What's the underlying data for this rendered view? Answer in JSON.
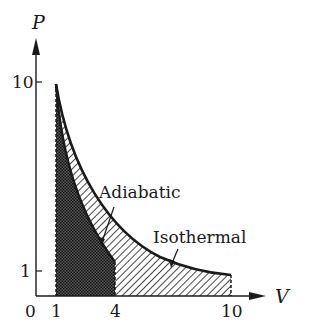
{
  "diagram": {
    "type": "PV-diagram",
    "axes": {
      "x_label": "V",
      "y_label": "P",
      "origin_label": "0",
      "x_ticks": [
        {
          "value": 1,
          "label": "1"
        },
        {
          "value": 4,
          "label": "4"
        },
        {
          "value": 10,
          "label": "10"
        }
      ],
      "y_ticks": [
        {
          "value": 10,
          "label": "10"
        },
        {
          "value": 1,
          "label": "1"
        }
      ]
    },
    "curves": [
      {
        "name": "Adiabatic",
        "label": "Adiabatic",
        "from": {
          "V": 1,
          "P": 10
        },
        "to": {
          "V": 4,
          "P": 1.4
        }
      },
      {
        "name": "Isothermal",
        "label": "Isothermal",
        "from": {
          "V": 1,
          "P": 10
        },
        "to": {
          "V": 10,
          "P": 1
        }
      }
    ],
    "shaded_regions": [
      {
        "name": "work-adiabatic",
        "pattern": "crosshatch",
        "V_range": [
          1,
          4
        ]
      },
      {
        "name": "work-isothermal",
        "pattern": "diagonal-hatch",
        "V_range": [
          1,
          10
        ]
      }
    ],
    "colors": {
      "ink": "#1a1a1a",
      "background": "#ffffff"
    }
  }
}
